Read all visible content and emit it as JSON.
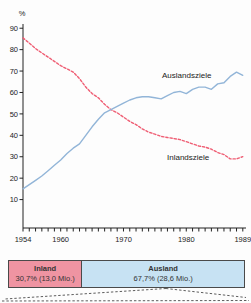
{
  "chart_data": {
    "type": "line",
    "title": "",
    "ylabel": "%",
    "xlabel": "",
    "grid": false,
    "ylim": [
      0,
      95
    ],
    "yticks": [
      10,
      20,
      30,
      40,
      50,
      60,
      70,
      80,
      90
    ],
    "xtick_labels": [
      "1954",
      "1960",
      "1970",
      "1980",
      "1989"
    ],
    "x": [
      1954,
      1955,
      1956,
      1957,
      1958,
      1959,
      1960,
      1961,
      1962,
      1963,
      1964,
      1965,
      1966,
      1967,
      1968,
      1969,
      1970,
      1971,
      1972,
      1973,
      1974,
      1975,
      1976,
      1977,
      1978,
      1979,
      1980,
      1981,
      1982,
      1983,
      1984,
      1985,
      1986,
      1987,
      1988,
      1989
    ],
    "series": [
      {
        "name": "Inlandsziele",
        "color": "#ef5d73",
        "line_style": "dashed",
        "values": [
          85.5,
          83,
          80.5,
          78.5,
          76.5,
          74.5,
          72.5,
          71,
          69.5,
          66.5,
          62.5,
          59.5,
          57.5,
          54.5,
          52,
          50.5,
          48.5,
          46.5,
          45,
          43,
          41.5,
          40.5,
          39.5,
          39,
          38.5,
          38,
          37,
          36,
          35,
          34.5,
          33.5,
          32,
          31,
          29,
          29,
          30
        ]
      },
      {
        "name": "Auslandsziele",
        "color": "#92b5d8",
        "line_style": "solid",
        "values": [
          15,
          17,
          19,
          21,
          23.5,
          26,
          28.5,
          31.5,
          34,
          36,
          40,
          44,
          47.5,
          50.5,
          52,
          53.5,
          55,
          56.5,
          57.5,
          58,
          58,
          57.5,
          57,
          58.5,
          60,
          60.5,
          59.5,
          61.5,
          62.5,
          62.5,
          61.5,
          64,
          64.5,
          67.5,
          69.5,
          68
        ]
      }
    ],
    "annotations": [
      {
        "text": "Auslandsziele"
      },
      {
        "text": "Inlandsziele"
      }
    ],
    "axis_color": "#222222"
  },
  "breakdown_bar": {
    "segments": [
      {
        "label": "Inland",
        "value_text": "30,7% (13,0 Mio.)",
        "pct": 30.7,
        "fill": "#ef94a2"
      },
      {
        "label": "Ausland",
        "value_text": "67,7% (28,6 Mio.)",
        "pct": 67.7,
        "fill": "#c7e2f3"
      }
    ]
  }
}
